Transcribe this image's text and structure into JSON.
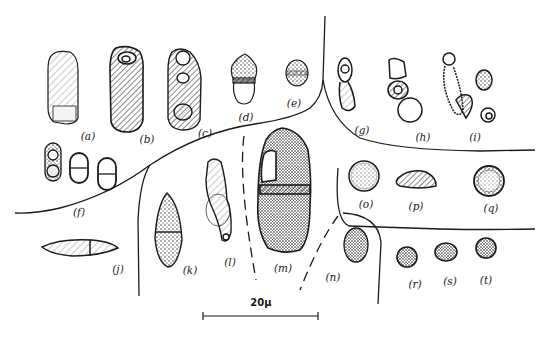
{
  "figure": {
    "type": "botanical spore illustration plate",
    "ink_color": "#1a1a1a",
    "background": "#ffffff",
    "specimens": [
      {
        "id": "a",
        "label": "(a)",
        "shape": "oblong cylindrical, hatched, pale lower cell"
      },
      {
        "id": "b",
        "label": "(b)",
        "shape": "oblong cylindrical, densely hatched, apical pore"
      },
      {
        "id": "c",
        "label": "(c)",
        "shape": "oblong multi-celled with rounded cells"
      },
      {
        "id": "d",
        "label": "(d)",
        "shape": "small two-celled, pointed apex"
      },
      {
        "id": "e",
        "label": "(e)",
        "shape": "small oval two-celled"
      },
      {
        "id": "f",
        "label": "(f)",
        "shape": "three paired two-celled ovals"
      },
      {
        "id": "g",
        "label": "(g)",
        "shape": "two-celled constricted"
      },
      {
        "id": "h",
        "label": "(h)",
        "shape": "germinating chain with round cell"
      },
      {
        "id": "i",
        "label": "(i)",
        "shape": "chained cells with round spores"
      },
      {
        "id": "j",
        "label": "(j)",
        "shape": "elongated fusiform, two-celled"
      },
      {
        "id": "k",
        "label": "(k)",
        "shape": "fusiform two-celled, reticulate"
      },
      {
        "id": "l",
        "label": "(l)",
        "shape": "elongate curved with stalk"
      },
      {
        "id": "m",
        "label": "(m)",
        "shape": "large stippled two-celled"
      },
      {
        "id": "n",
        "label": "(n)",
        "shape": "oval stippled"
      },
      {
        "id": "o",
        "label": "(o)",
        "shape": "round"
      },
      {
        "id": "p",
        "label": "(p)",
        "shape": "reniform"
      },
      {
        "id": "q",
        "label": "(q)",
        "shape": "round, stippled"
      },
      {
        "id": "r",
        "label": "(r)",
        "shape": "small round stippled"
      },
      {
        "id": "s",
        "label": "(s)",
        "shape": "small round stippled"
      },
      {
        "id": "t",
        "label": "(t)",
        "shape": "small round stippled"
      }
    ],
    "scale_bar": {
      "label": "20μ",
      "length_units": 20,
      "unit": "μ"
    }
  }
}
